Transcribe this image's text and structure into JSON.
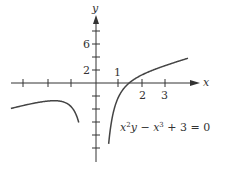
{
  "chart_data": {
    "type": "line",
    "title": "",
    "annotation": "x²y − x³ + 3 = 0",
    "equation": {
      "lhs_parts": [
        "x",
        "2",
        "y − ",
        "x",
        "3",
        " + 3 = 0"
      ]
    },
    "xlabel": "x",
    "ylabel": "y",
    "x_tick_labels": [
      "1",
      "2",
      "3"
    ],
    "y_tick_labels": [
      "2",
      "6"
    ],
    "x_ticks": [
      -3,
      -2,
      -1,
      1,
      2,
      3
    ],
    "y_ticks": [
      -10,
      -8,
      -6,
      -4,
      -2,
      2,
      4,
      6,
      8
    ],
    "xlim": [
      -3.7,
      4.4
    ],
    "ylim": [
      -12,
      10
    ],
    "grid": false,
    "legend": null,
    "series": [
      {
        "name": "y = x − 3/x² (x < 0 branch)",
        "x": [
          -3.7,
          -3.0,
          -2.5,
          -2.0,
          -1.8,
          -1.5,
          -1.2,
          -1.0,
          -0.9,
          -0.8,
          -0.75
        ],
        "y": [
          -3.92,
          -3.33,
          -2.98,
          -2.75,
          -2.73,
          -2.83,
          -3.28,
          -4.0,
          -4.6,
          -5.49,
          -6.08
        ]
      },
      {
        "name": "y = x − 3/x² (x > 0 branch)",
        "x": [
          0.55,
          0.6,
          0.7,
          0.8,
          1.0,
          1.2,
          1.44,
          1.8,
          2.0,
          2.5,
          3.0,
          3.5,
          4.0
        ],
        "y": [
          -9.37,
          -7.73,
          -5.42,
          -3.89,
          -2.0,
          -0.88,
          0.0,
          0.87,
          1.25,
          2.02,
          2.67,
          3.26,
          3.81
        ]
      }
    ]
  },
  "colors": {
    "axis": "#333333",
    "curve": "#444444",
    "background": "#ffffff"
  }
}
